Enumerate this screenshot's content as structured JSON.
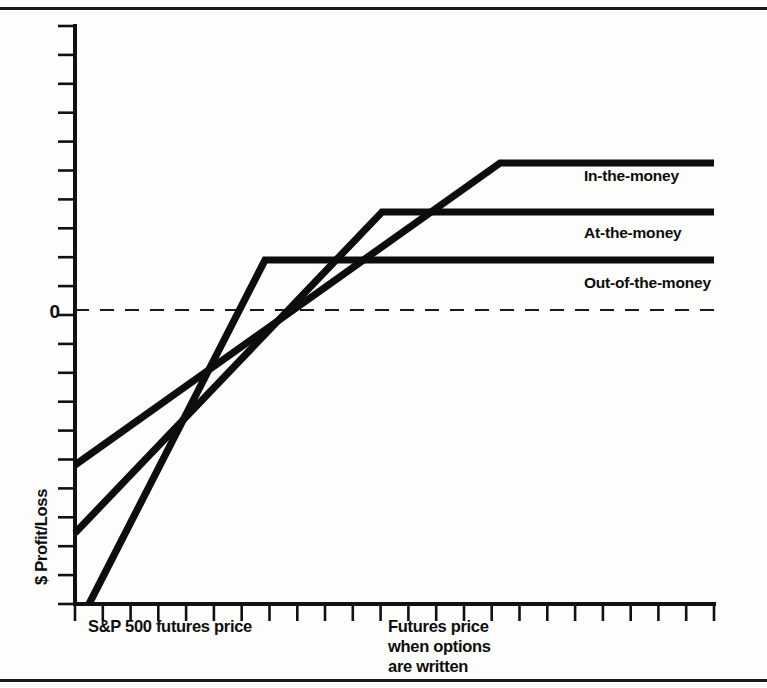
{
  "figure": {
    "kind": "option-payoff-diagram",
    "background_color": "#fdfdfc",
    "ink_color": "#0d0d0d",
    "has_top_rule": true,
    "has_bottom_rule": true
  },
  "axes": {
    "y_label": "$ Profit/Loss",
    "zero_label": "0",
    "x_caption_left": "S&P 500 futures price",
    "x_caption_right_lines": [
      "Futures price",
      "when options",
      "are written"
    ],
    "y_tick_count": 21,
    "x_tick_count": 24,
    "grid": false
  },
  "legend": {
    "position": "inside-right",
    "entries": [
      {
        "label": "In-the-money"
      },
      {
        "label": "At-the-money"
      },
      {
        "label": "Out-of-the-money"
      }
    ]
  },
  "chart_data": {
    "type": "line",
    "title": "",
    "subtitle": "",
    "xlabel": "S&P 500 futures price",
    "ylabel": "$ Profit/Loss",
    "xlim": [
      0,
      100
    ],
    "ylim": [
      -100,
      100
    ],
    "grid": false,
    "legend_position": "inside-right",
    "annotations": [
      {
        "text": "0",
        "x": -3,
        "y": 0,
        "role": "zero-axis-label"
      },
      {
        "text": "S&P 500 futures price",
        "x": 6,
        "y": -118,
        "role": "x-axis-caption-left"
      },
      {
        "text": "Futures price when options are written",
        "x": 52,
        "y": -118,
        "role": "x-axis-caption-right"
      }
    ],
    "reference_lines": [
      {
        "label": "zero profit",
        "orientation": "horizontal",
        "y": 0,
        "style": "dashed"
      }
    ],
    "series": [
      {
        "name": "In-the-money",
        "style": "solid",
        "x": [
          0,
          30.2,
          100
        ],
        "y": [
          -52.3,
          35.5,
          35.5
        ],
        "kink_x": 30.2,
        "plateau_y": 35.5,
        "breakeven_x": 12.1
      },
      {
        "name": "At-the-money",
        "style": "solid",
        "x": [
          0,
          48.4,
          100
        ],
        "y": [
          -73.1,
          25.0,
          25.0
        ],
        "kink_x": 48.4,
        "plateau_y": 25.0,
        "breakeven_x": 30.5
      },
      {
        "name": "Out-of-the-money",
        "style": "solid",
        "x": [
          2.3,
          66.7,
          100
        ],
        "y": [
          -100.0,
          14.4,
          14.4
        ],
        "kink_x": 66.7,
        "plateau_y": 14.4,
        "breakeven_x": 48.9
      }
    ],
    "pixel_geometry": {
      "plot_left": 75,
      "plot_right": 714,
      "plot_top": 26,
      "plot_bottom": 604,
      "zero_y": 310,
      "series_px": [
        {
          "name": "In-the-money",
          "p0": [
            75,
            465
          ],
          "p1": [
            500,
            163
          ],
          "p2": [
            714,
            163
          ],
          "label_xy": [
            584,
            181
          ]
        },
        {
          "name": "At-the-money",
          "p0": [
            75,
            533
          ],
          "p1": [
            382,
            212
          ],
          "p2": [
            714,
            212
          ],
          "label_xy": [
            584,
            238
          ]
        },
        {
          "name": "Out-of-the-money",
          "p0": [
            89,
            604
          ],
          "p1": [
            265,
            260
          ],
          "p2": [
            714,
            260
          ],
          "label_xy": [
            584,
            288
          ]
        }
      ]
    }
  }
}
